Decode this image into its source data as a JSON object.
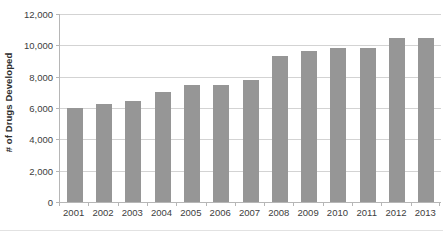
{
  "chart_data": {
    "type": "bar",
    "title": "",
    "xlabel": "",
    "ylabel": "# of Drugs Developed",
    "categories": [
      "2001",
      "2002",
      "2003",
      "2004",
      "2005",
      "2006",
      "2007",
      "2008",
      "2009",
      "2010",
      "2011",
      "2012",
      "2013"
    ],
    "values": [
      6000,
      6250,
      6450,
      7000,
      7450,
      7450,
      7800,
      9300,
      9650,
      9800,
      9800,
      10500,
      10500
    ],
    "ylim": [
      0,
      12000
    ],
    "ytick_step": 2000,
    "ytick_labels": [
      "0",
      "2,000",
      "4,000",
      "6,000",
      "8,000",
      "10,000",
      "12,000"
    ],
    "ytick_values": [
      0,
      2000,
      4000,
      6000,
      8000,
      10000,
      12000
    ],
    "grid": true,
    "legend": false,
    "legend_position": "none",
    "series": [
      {
        "name": "# of Drugs Developed",
        "values": [
          6000,
          6250,
          6450,
          7000,
          7450,
          7450,
          7800,
          9300,
          9650,
          9800,
          9800,
          10500,
          10500
        ]
      }
    ],
    "colors": {
      "bar_fill": "#969696",
      "gridline": "#d3d3d3",
      "axis_line": "#b6b6b6",
      "tick_text": "#404040",
      "axis_title_text": "#2f2f2f",
      "plot_background": "#ffffff"
    }
  }
}
